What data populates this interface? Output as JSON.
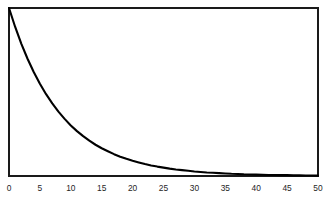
{
  "chart_data": {
    "type": "line",
    "title": "",
    "subtitle": "",
    "xlabel": "",
    "ylabel": "",
    "xlim": [
      0,
      50
    ],
    "ylim": [
      0,
      1
    ],
    "xticks": [
      0,
      5,
      10,
      15,
      20,
      25,
      30,
      35,
      40,
      45,
      50
    ],
    "xtick_labels": [
      "0",
      "5",
      "10",
      "15",
      "20",
      "25",
      "30",
      "35",
      "40",
      "45",
      "50"
    ],
    "yticks": [],
    "ytick_labels": [],
    "grid": false,
    "legend": false,
    "legend_position": "none",
    "annotations": [],
    "series": [
      {
        "name": "exponential decay",
        "color": "#000000",
        "linewidth": 2.1,
        "x": [
          0,
          1,
          2,
          3,
          4,
          5,
          6,
          7,
          8,
          9,
          10,
          11,
          12,
          13,
          14,
          15,
          16,
          17,
          18,
          19,
          20,
          21,
          22,
          23,
          24,
          25,
          26,
          27,
          28,
          29,
          30,
          31,
          32,
          33,
          34,
          35,
          36,
          37,
          38,
          39,
          40,
          41,
          42,
          43,
          44,
          45,
          46,
          47,
          48,
          49,
          50
        ],
        "values": [
          1.0,
          0.887,
          0.787,
          0.698,
          0.619,
          0.549,
          0.487,
          0.432,
          0.383,
          0.34,
          0.301,
          0.267,
          0.237,
          0.21,
          0.186,
          0.165,
          0.147,
          0.13,
          0.115,
          0.102,
          0.091,
          0.081,
          0.071,
          0.063,
          0.056,
          0.05,
          0.044,
          0.039,
          0.035,
          0.031,
          0.027,
          0.024,
          0.021,
          0.019,
          0.017,
          0.015,
          0.013,
          0.012,
          0.01,
          0.009,
          0.008,
          0.007,
          0.006,
          0.006,
          0.005,
          0.005,
          0.004,
          0.004,
          0.003,
          0.003,
          0.002
        ]
      }
    ]
  },
  "figure": {
    "background_color": "#ffffff",
    "frame_color": "#1a1a1a",
    "curve_color": "#000000"
  }
}
